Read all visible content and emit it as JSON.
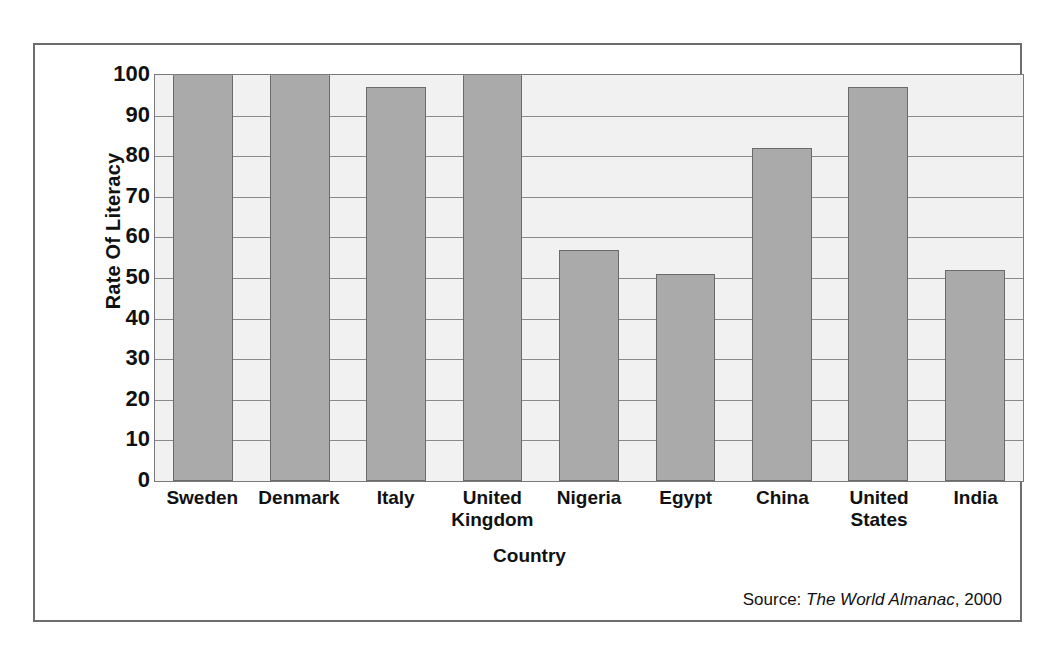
{
  "figure": {
    "source_prefix": "Source:",
    "source_title": "The World Almanac",
    "source_suffix": ", 2000"
  },
  "chart_data": {
    "type": "bar",
    "title": "",
    "xlabel": "Country",
    "ylabel": "Rate Of Literacy",
    "categories": [
      "Sweden",
      "Denmark",
      "Italy",
      "United\nKingdom",
      "Nigeria",
      "Egypt",
      "China",
      "United\nStates",
      "India"
    ],
    "values": [
      100,
      100,
      97,
      100,
      57,
      51,
      82,
      97,
      52
    ],
    "ylim": [
      0,
      100
    ],
    "yticks": [
      100,
      90,
      80,
      70,
      60,
      50,
      40,
      30,
      20,
      10,
      0
    ],
    "ytick_labels": [
      "100",
      "90",
      "80",
      "70",
      "60",
      "50",
      "40",
      "30",
      "20",
      "10",
      "0"
    ],
    "grid": true,
    "legend": false,
    "bar_color": "#aaaaaa",
    "bar_border_color": "#6a6a6a",
    "plot_background": "#f1f1f1",
    "gridline_color": "#8a8a8a",
    "frame_color": "#6d6d6d"
  }
}
